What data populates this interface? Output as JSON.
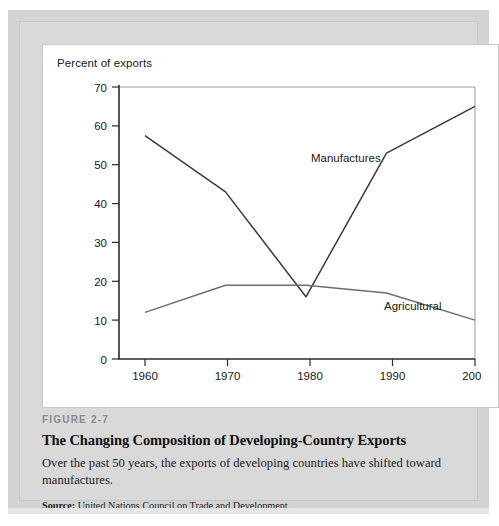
{
  "figure": {
    "number_label": "FIGURE 2-7",
    "title": "The Changing Composition of Developing-Country Exports",
    "description": "Over the past 50 years, the exports of developing countries have shifted toward manufactures.",
    "source_label": "Source:",
    "source_text": "United Nations Council on Trade and Development."
  },
  "chart_data": {
    "type": "line",
    "title": "",
    "ylabel": "Percent of exports",
    "xlabel": "",
    "categories": [
      "1960",
      "1970",
      "1980",
      "1990",
      "2001"
    ],
    "x": [
      1960,
      1970,
      1980,
      1990,
      2001
    ],
    "ylim": [
      0,
      70
    ],
    "yticks": [
      0,
      10,
      20,
      30,
      40,
      50,
      60,
      70
    ],
    "ytick_labels": [
      "0",
      "10",
      "20",
      "30",
      "40",
      "50",
      "60",
      "70"
    ],
    "xtick_labels": [
      "1960",
      "1970",
      "1980",
      "1990",
      "2001"
    ],
    "grid": false,
    "legend_position": "inline-annotation",
    "series": [
      {
        "name": "Manufactures",
        "values": [
          57.5,
          43.0,
          16.0,
          53.0,
          65.0
        ],
        "color": "#3a3a3a",
        "label_text": "Manufactures"
      },
      {
        "name": "Agricultural",
        "values": [
          12.0,
          19.0,
          19.0,
          17.0,
          10.0
        ],
        "color": "#6e6e6e",
        "label_text": "Agricultural"
      }
    ],
    "annotations": [
      {
        "text": "Manufactures",
        "x": 1982,
        "y": 57
      },
      {
        "text": "Agricultural",
        "x": 1992,
        "y": 22
      }
    ]
  },
  "colors": {
    "page_background": "#ffffff",
    "plate": "#d9d9d9",
    "card": "#ffffff",
    "axis": "#333333",
    "series_manufactures": "#3a3a3a",
    "series_agricultural": "#6e6e6e",
    "figure_number": "#8a8a8a"
  }
}
